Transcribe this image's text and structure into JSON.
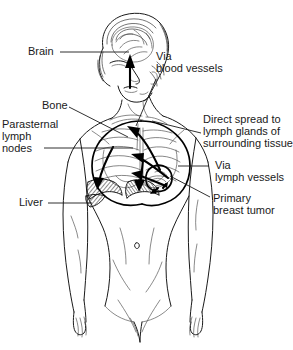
{
  "figure": {
    "background_color": "#ffffff",
    "line_color": "#1a1a1a",
    "width": 293,
    "height": 350
  },
  "labels": {
    "brain": "Brain",
    "via_blood_vessels_line1": "Via",
    "via_blood_vessels_line2": "blood vessels",
    "bone": "Bone",
    "parasternal_line1": "Parasternal",
    "parasternal_line2": "lymph",
    "parasternal_line3": "nodes",
    "direct_spread_line1": "Direct spread to",
    "direct_spread_line2": "lymph glands of",
    "direct_spread_line3": "surrounding tissue",
    "via_lymph_line1": "Via",
    "via_lymph_line2": "lymph vessels",
    "primary_tumor_line1": "Primary",
    "primary_tumor_line2": "breast tumor",
    "liver": "Liver"
  }
}
